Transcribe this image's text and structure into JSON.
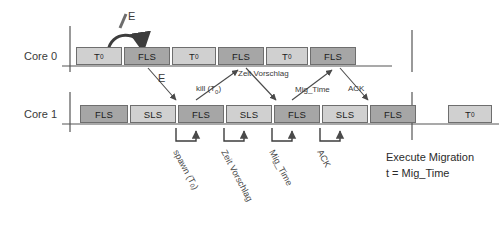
{
  "diagram": {
    "colors": {
      "light_block": "#d0d0d0",
      "dark_block": "#a6a6a6",
      "block_border": "#6e6e6e",
      "axis": "#555555",
      "text": "#2b2b2b"
    },
    "lanes": [
      {
        "id": "core0",
        "label": "Core 0",
        "blocks": [
          {
            "text": "T",
            "sub": "0",
            "shade": "light",
            "x": 76,
            "w": 46
          },
          {
            "text": "FLS",
            "sub": "",
            "shade": "dark",
            "x": 124,
            "w": 46
          },
          {
            "text": "T",
            "sub": "0",
            "shade": "light",
            "x": 172,
            "w": 44
          },
          {
            "text": "FLS",
            "sub": "",
            "shade": "dark",
            "x": 218,
            "w": 46
          },
          {
            "text": "T",
            "sub": "0",
            "shade": "light",
            "x": 266,
            "w": 42
          },
          {
            "text": "FLS",
            "sub": "",
            "shade": "dark",
            "x": 310,
            "w": 46
          }
        ]
      },
      {
        "id": "core1",
        "label": "Core 1",
        "blocks": [
          {
            "text": "FLS",
            "sub": "",
            "shade": "dark",
            "x": 80,
            "w": 48
          },
          {
            "text": "SLS",
            "sub": "",
            "shade": "light",
            "x": 130,
            "w": 46
          },
          {
            "text": "FLS",
            "sub": "",
            "shade": "dark",
            "x": 178,
            "w": 46
          },
          {
            "text": "SLS",
            "sub": "",
            "shade": "light",
            "x": 226,
            "w": 46
          },
          {
            "text": "FLS",
            "sub": "",
            "shade": "dark",
            "x": 274,
            "w": 46
          },
          {
            "text": "SLS",
            "sub": "",
            "shade": "light",
            "x": 322,
            "w": 46
          },
          {
            "text": "FLS",
            "sub": "",
            "shade": "dark",
            "x": 370,
            "w": 46
          },
          {
            "text": "T",
            "sub": "0",
            "shade": "light",
            "x": 448,
            "w": 44
          }
        ]
      }
    ],
    "annotations": {
      "event_top": "E",
      "event_mid": "E",
      "kill": "kill (T",
      "kill_sub": "0",
      "kill_close": ")",
      "zeit_vorschlag": "Zeit Vorschlag",
      "mig_time": "Mig_Time",
      "ack": "ACK"
    },
    "bottom_labels": [
      {
        "text": "spawn (T",
        "sub": "0",
        "close": ")",
        "x": 176,
        "y": 146
      },
      {
        "text": "Zeit Vorschlag",
        "sub": "",
        "close": "",
        "x": 224,
        "y": 146
      },
      {
        "text": "Mig_Time",
        "sub": "",
        "close": "",
        "x": 272,
        "y": 146
      },
      {
        "text": "ACK",
        "sub": "",
        "close": "",
        "x": 320,
        "y": 146
      }
    ],
    "footer": {
      "line1": "Execute Migration",
      "line2": "t = Mig_Time"
    }
  }
}
